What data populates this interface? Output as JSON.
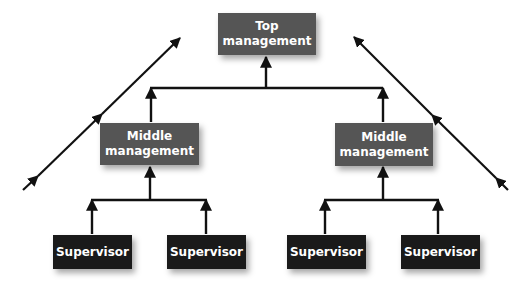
{
  "diagram": {
    "type": "organizational-hierarchy",
    "colors": {
      "management_box": "#555555",
      "supervisor_box": "#1a1a1a",
      "text": "#ffffff",
      "lines": "#111111"
    },
    "top": {
      "line1": "Top",
      "line2": "management"
    },
    "middle": [
      {
        "line1": "Middle",
        "line2": "management"
      },
      {
        "line1": "Middle",
        "line2": "management"
      }
    ],
    "supervisors": [
      {
        "label": "Supervisor"
      },
      {
        "label": "Supervisor"
      },
      {
        "label": "Supervisor"
      },
      {
        "label": "Supervisor"
      }
    ],
    "side_arrows": [
      {
        "direction": "up-right",
        "side": "left"
      },
      {
        "direction": "up-left",
        "side": "right"
      }
    ]
  }
}
